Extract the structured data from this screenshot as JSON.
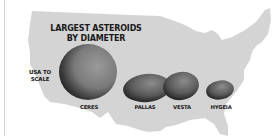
{
  "infographic": {
    "title_line1": "LARGEST ASTEROIDS",
    "title_line2": "BY DIAMETER",
    "scale_label_line1": "USA TO",
    "scale_label_line2": "SCALE",
    "asteroids": [
      {
        "name": "CERES"
      },
      {
        "name": "PALLAS"
      },
      {
        "name": "VESTA"
      },
      {
        "name": "HYGEIA"
      }
    ],
    "colors": {
      "map_fill": "#d4d4d4",
      "asteroid_dark": "#3a3a3a",
      "asteroid_light": "#8a8a8a",
      "text": "#1a1a1a"
    }
  }
}
